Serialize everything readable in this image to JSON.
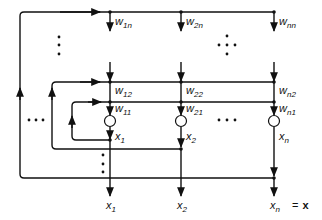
{
  "diagram": {
    "weights": {
      "w_1n": {
        "base": "w",
        "sub": "1n"
      },
      "w_2n": {
        "base": "w",
        "sub": "2n"
      },
      "w_nn": {
        "base": "w",
        "sub": "nn"
      },
      "w_12": {
        "base": "w",
        "sub": "12"
      },
      "w_22": {
        "base": "w",
        "sub": "22"
      },
      "w_n2": {
        "base": "w",
        "sub": "n2"
      },
      "w_11": {
        "base": "w",
        "sub": "11"
      },
      "w_21": {
        "base": "w",
        "sub": "21"
      },
      "w_n1": {
        "base": "w",
        "sub": "n1"
      }
    },
    "node_outputs": [
      {
        "base": "x",
        "sub": "1"
      },
      {
        "base": "x",
        "sub": "2"
      },
      {
        "base": "x",
        "sub": "n"
      }
    ],
    "outputs": [
      {
        "base": "x",
        "sub": "1"
      },
      {
        "base": "x",
        "sub": "2"
      },
      {
        "base": "x",
        "sub": "n"
      }
    ],
    "output_equation": {
      "equals": "=",
      "vector": "x"
    },
    "ellipsis": "•••"
  }
}
